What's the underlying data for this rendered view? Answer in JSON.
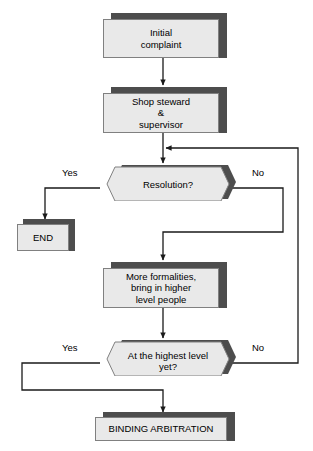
{
  "diagram": {
    "background_color": "#ffffff",
    "node_fill_color": "#e9e9e9",
    "node_border_color": "#808080",
    "shadow_color": "#4d4d4d",
    "line_color": "#1a1a1a",
    "text_color": "#000000"
  },
  "nodes": {
    "initial_complaint": {
      "label": "Initial\ncomplaint",
      "shape": "process"
    },
    "shop_steward": {
      "label": "Shop steward\n&\nsupervisor",
      "shape": "process"
    },
    "resolution_decision": {
      "label": "Resolution?",
      "shape": "decision"
    },
    "end_node": {
      "label": "END",
      "shape": "process"
    },
    "more_formalities": {
      "label": "More formalities,\nbring in higher\nlevel people",
      "shape": "process"
    },
    "highest_level_decision": {
      "label": "At the highest level\nyet?",
      "shape": "decision"
    },
    "binding_arbitration": {
      "label": "BINDING ARBITRATION",
      "shape": "process"
    }
  },
  "branch_labels": {
    "resolution_yes": "Yes",
    "resolution_no": "No",
    "highest_level_yes": "Yes",
    "highest_level_no": "No"
  },
  "edges": [
    {
      "name": "complaint-to-steward",
      "from": "initial_complaint",
      "to": "shop_steward",
      "label": ""
    },
    {
      "name": "steward-to-resolution",
      "from": "shop_steward",
      "to": "resolution_decision",
      "label": ""
    },
    {
      "name": "resolution-yes-to-end",
      "from": "resolution_decision",
      "to": "end_node",
      "label": "Yes"
    },
    {
      "name": "resolution-no-to-formalities",
      "from": "resolution_decision",
      "to": "more_formalities",
      "label": "No"
    },
    {
      "name": "formalities-to-highest-level",
      "from": "more_formalities",
      "to": "highest_level_decision",
      "label": ""
    },
    {
      "name": "highest-yes-to-arbitration",
      "from": "highest_level_decision",
      "to": "binding_arbitration",
      "label": "Yes"
    },
    {
      "name": "highest-no-to-resolution",
      "from": "highest_level_decision",
      "to": "resolution_decision",
      "label": "No"
    }
  ]
}
